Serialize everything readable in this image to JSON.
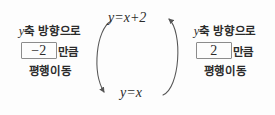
{
  "diagram": {
    "background_color": "#fdfdfd",
    "stroke_color": "#555555",
    "text_color": "#2b2b2b",
    "box_border_color": "#8c8c8c",
    "equations": {
      "top": {
        "lhs": "y",
        "eq": "=",
        "rhs": "x",
        "op": "+",
        "constant": "2",
        "full": "y=x+2"
      },
      "bottom": {
        "lhs": "y",
        "eq": "=",
        "rhs": "x",
        "full": "y=x"
      }
    },
    "arrows": {
      "left_arc": {
        "name": "down-arrow-left-arc",
        "direction": "downward",
        "from": "y=x+2",
        "to": "y=x"
      },
      "right_arc": {
        "name": "up-arrow-right-arc",
        "direction": "upward",
        "from": "y=x",
        "to": "y=x+2"
      }
    }
  },
  "left_block": {
    "axis_var": "y",
    "axis_text": "축 방향으로",
    "value": "−2",
    "suffix": "만큼",
    "move_text": "평행이동"
  },
  "right_block": {
    "axis_var": "y",
    "axis_text": "축 방향으로",
    "value": "2",
    "suffix": "만큼",
    "move_text": "평행이동"
  }
}
